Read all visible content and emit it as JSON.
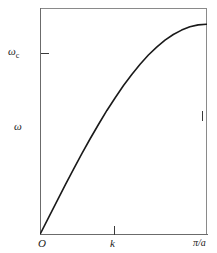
{
  "figure": {
    "background_color": "#ffffff",
    "frame_color": "#8a8a8a",
    "axis_color": "#6b6b6b",
    "curve_color": "#1a1a1a"
  },
  "labels": {
    "omega_c": "ω",
    "omega_c_sub": "c",
    "omega_axis": "ω",
    "origin": "O",
    "k_axis": "k",
    "pi_over_a": "π/a"
  },
  "chart_data": {
    "type": "line",
    "title": "",
    "xlabel": "k",
    "ylabel": "ω",
    "xlim": [
      0,
      1
    ],
    "ylim": [
      0,
      1.08
    ],
    "grid": false,
    "legend": null,
    "xtick_labels": [
      "O",
      "",
      "π/a"
    ],
    "xtick_values": [
      0,
      0.44,
      1
    ],
    "ytick_labels": [
      "ωc"
    ],
    "ytick_values": [
      1.0
    ],
    "annotations": [
      {
        "text": "ωc",
        "x": 0,
        "y": 1.0,
        "position": "left-of-axis"
      },
      {
        "text": "ω",
        "x": 0,
        "y": 0.55,
        "position": "axis-label"
      },
      {
        "text": "O",
        "x": 0,
        "y": 0,
        "position": "below-origin"
      },
      {
        "text": "k",
        "x": 0.44,
        "y": 0,
        "position": "below-axis"
      },
      {
        "text": "π/a",
        "x": 1.0,
        "y": 0,
        "position": "below-axis-right"
      }
    ],
    "series": [
      {
        "name": "dispersion ω = ωc sin(ka/2)",
        "x": [
          0.0,
          0.05,
          0.1,
          0.15,
          0.2,
          0.25,
          0.3,
          0.35,
          0.4,
          0.45,
          0.5,
          0.55,
          0.6,
          0.65,
          0.7,
          0.75,
          0.8,
          0.85,
          0.9,
          0.95,
          1.0
        ],
        "y": [
          0.0,
          0.078,
          0.156,
          0.233,
          0.309,
          0.383,
          0.454,
          0.522,
          0.588,
          0.649,
          0.707,
          0.76,
          0.809,
          0.853,
          0.891,
          0.924,
          0.951,
          0.972,
          0.988,
          0.997,
          1.0
        ]
      }
    ]
  }
}
